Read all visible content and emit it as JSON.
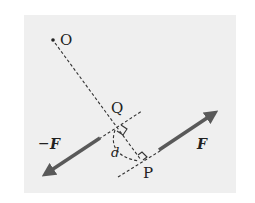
{
  "diagram": {
    "title": "",
    "colors": {
      "background": "#ffffff",
      "panel": "#efefef",
      "line": "#333333",
      "arrow": "#595959",
      "text": "#222222"
    },
    "points": {
      "O": {
        "label": "O",
        "x": 53,
        "y": 40
      },
      "Q": {
        "label": "Q",
        "x": 117,
        "y": 127
      },
      "P": {
        "label": "P",
        "x": 141,
        "y": 159
      }
    },
    "labels": {
      "force_pos": "F",
      "force_neg_sign": "−",
      "force_neg": "F",
      "distance": "d"
    },
    "elements": [
      {
        "type": "dashed-line",
        "name": "O-to-P",
        "from": "O",
        "to": "P"
      },
      {
        "type": "dashed-line",
        "name": "line-of-action-neg-F",
        "through": "Q"
      },
      {
        "type": "dashed-line",
        "name": "line-of-action-F",
        "through": "P"
      },
      {
        "type": "arrow",
        "name": "force -F",
        "direction": "down-left"
      },
      {
        "type": "arrow",
        "name": "force F",
        "direction": "up-right"
      },
      {
        "type": "right-angle-marker",
        "at": "Q"
      },
      {
        "type": "right-angle-marker",
        "at": "P"
      },
      {
        "type": "dashed-arc",
        "name": "distance d",
        "from": "Q",
        "to": "P"
      }
    ]
  }
}
